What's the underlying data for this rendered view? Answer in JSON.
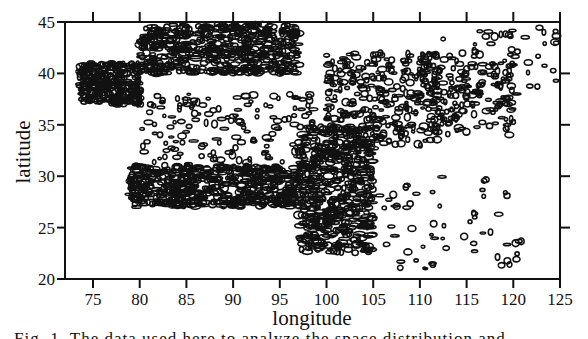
{
  "chart_data": {
    "type": "scatter",
    "title": "",
    "xlabel": "longitude",
    "ylabel": "latitude",
    "xlim": [
      72,
      125
    ],
    "ylim": [
      20,
      45
    ],
    "xticks": [
      75,
      80,
      85,
      90,
      95,
      100,
      105,
      110,
      115,
      120,
      125
    ],
    "yticks": [
      20,
      25,
      30,
      35,
      40,
      45
    ],
    "grid": false,
    "legend": null,
    "style": "black contour outlines (dense clusters) over white background",
    "density_regions": [
      {
        "name": "Tarim / Tian Shan belt",
        "lon": [
          80,
          97
        ],
        "lat": [
          40,
          45
        ],
        "density": "very high"
      },
      {
        "name": "Western Kunlun tip",
        "lon": [
          73.5,
          80
        ],
        "lat": [
          37,
          41
        ],
        "density": "high"
      },
      {
        "name": "Tibetan Plateau interior",
        "lon": [
          80,
          100
        ],
        "lat": [
          30,
          38
        ],
        "density": "medium"
      },
      {
        "name": "Himalayan southern margin",
        "lon": [
          79,
          97
        ],
        "lat": [
          27,
          31
        ],
        "density": "very high"
      },
      {
        "name": "Sichuan-Yunnan",
        "lon": [
          97,
          105
        ],
        "lat": [
          22.5,
          35
        ],
        "density": "very high"
      },
      {
        "name": "North-South seismic belt / Ordos rim",
        "lon": [
          100,
          112
        ],
        "lat": [
          33,
          42
        ],
        "density": "high"
      },
      {
        "name": "North China",
        "lon": [
          110,
          120
        ],
        "lat": [
          34,
          42
        ],
        "density": "medium"
      },
      {
        "name": "Southeast China",
        "lon": [
          105,
          121
        ],
        "lat": [
          21,
          30
        ],
        "density": "low"
      },
      {
        "name": "Northeast fringe",
        "lon": [
          112,
          125
        ],
        "lat": [
          38,
          44.5
        ],
        "density": "low"
      }
    ]
  },
  "axes": {
    "x_title": "longitude",
    "y_title": "latitude"
  },
  "caption": {
    "text": "Fig. 1. The  data  used  here  to  analyze  the  space  distribution  and"
  }
}
